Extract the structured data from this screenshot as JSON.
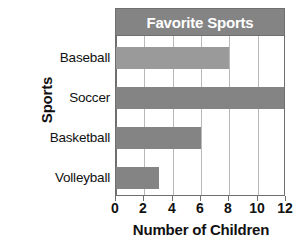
{
  "chart_data": {
    "type": "bar",
    "orientation": "horizontal",
    "title": "Favorite Sports",
    "xlabel": "Number of Children",
    "ylabel": "Sports",
    "categories": [
      "Baseball",
      "Soccer",
      "Basketball",
      "Volleyball"
    ],
    "values": [
      8,
      12,
      6,
      3
    ],
    "xlim": [
      0,
      12
    ],
    "xticks": [
      0,
      2,
      4,
      6,
      8,
      10,
      12
    ],
    "xtick_labels": [
      "0",
      "2",
      "4",
      "6",
      "8",
      "10",
      "12"
    ],
    "grid": "vertical",
    "legend": "none",
    "bar_colors": [
      "#9a9a9a",
      "#848484",
      "#848484",
      "#848484"
    ],
    "title_band_color": "#848484",
    "title_text_color": "#ffffff",
    "gridline_color": "#b9b9b9",
    "axis_color": "#6f6f6f",
    "background_color": "#ffffff"
  }
}
